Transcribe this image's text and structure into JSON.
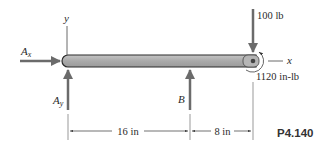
{
  "figure": {
    "problem_id": "P4.140",
    "axes": {
      "x_label": "x",
      "y_label": "y"
    },
    "reactions": {
      "ax": {
        "symbol": "A",
        "subscript": "x"
      },
      "ay": {
        "symbol": "A",
        "subscript": "y"
      },
      "b": {
        "symbol": "B"
      }
    },
    "loads": {
      "force": "100 lb",
      "moment": "1120 in-lb"
    },
    "dimensions": [
      {
        "label": "16 in"
      },
      {
        "label": "8 in"
      }
    ],
    "colors": {
      "beam_fill": "#a9a9a9",
      "beam_outline": "#2b2b2b",
      "arrow": "#6b6b6b",
      "line": "#555555"
    }
  }
}
